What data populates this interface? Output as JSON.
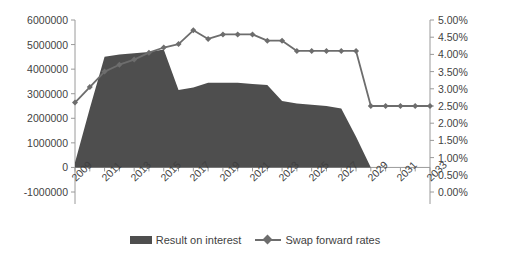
{
  "chart_data": {
    "type": "area",
    "title": "",
    "xlabel": "",
    "ylabel": "",
    "grid": false,
    "legend_position": "bottom",
    "x": [
      2009,
      2010,
      2011,
      2012,
      2013,
      2014,
      2015,
      2016,
      2017,
      2018,
      2019,
      2020,
      2021,
      2022,
      2023,
      2024,
      2025,
      2026,
      2027,
      2028,
      2029,
      2030,
      2031,
      2032,
      2033
    ],
    "x_tick_labels": [
      "2009",
      "2011",
      "2013",
      "2015",
      "2017",
      "2019",
      "2021",
      "2023",
      "2025",
      "2027",
      "2029",
      "2031",
      "2033"
    ],
    "axes": {
      "left": {
        "label": "",
        "ylim": [
          -1000000,
          6000000
        ],
        "ticks": [
          -1000000,
          0,
          1000000,
          2000000,
          3000000,
          4000000,
          5000000,
          6000000
        ],
        "tick_labels": [
          "-1000000",
          "0",
          "1000000",
          "2000000",
          "3000000",
          "4000000",
          "5000000",
          "6000000"
        ]
      },
      "right": {
        "label": "",
        "ylim": [
          0,
          5
        ],
        "ticks": [
          0,
          0.5,
          1,
          1.5,
          2,
          2.5,
          3,
          3.5,
          4,
          4.5,
          5
        ],
        "tick_labels": [
          "0.00%",
          "0.50%",
          "1.00%",
          "1.50%",
          "2.00%",
          "2.50%",
          "3.00%",
          "3.50%",
          "4.00%",
          "4.50%",
          "5.00%"
        ]
      }
    },
    "series": [
      {
        "name": "Result on interest",
        "kind": "area",
        "axis": "left",
        "color": "#4e4e4e",
        "values": [
          200000,
          2400000,
          4500000,
          4600000,
          4650000,
          4700000,
          4800000,
          3150000,
          3250000,
          3450000,
          3450000,
          3450000,
          3400000,
          3350000,
          2700000,
          2600000,
          2550000,
          2500000,
          2400000,
          1250000,
          0,
          0,
          0,
          0,
          0
        ]
      },
      {
        "name": "Swap forward rates",
        "kind": "line",
        "axis": "right",
        "color": "#6d6d6d",
        "marker": "diamond",
        "values": [
          2.6,
          3.05,
          3.5,
          3.7,
          3.85,
          4.05,
          4.2,
          4.3,
          4.7,
          4.45,
          4.58,
          4.58,
          4.58,
          4.4,
          4.4,
          4.1,
          4.1,
          4.1,
          4.1,
          4.1,
          2.5,
          2.5,
          2.5,
          2.5,
          2.5
        ]
      }
    ]
  },
  "legend": {
    "items": [
      {
        "label": "Result on interest",
        "type": "area"
      },
      {
        "label": "Swap forward rates",
        "type": "line"
      }
    ]
  },
  "colors": {
    "area": "#4e4e4e",
    "line": "#6d6d6d",
    "axis": "#9a9a9a",
    "text": "#3f3f3f"
  }
}
